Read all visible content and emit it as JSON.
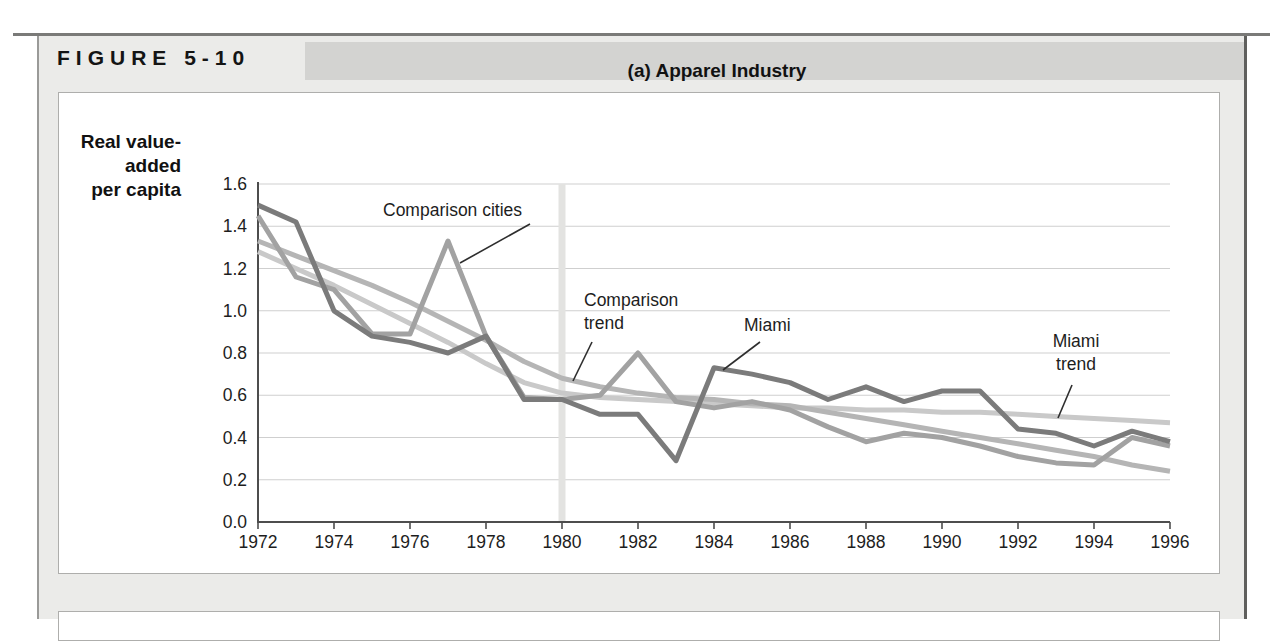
{
  "figure": {
    "label": "FIGURE 5-10"
  },
  "panel": {
    "title": "(a) Apparel Industry",
    "y_axis_label": "Real value-\nadded\nper capita"
  },
  "chart_data": {
    "type": "line",
    "title": "(a) Apparel Industry",
    "xlabel": "",
    "ylabel": "Real value-added per capita",
    "xlim": [
      1972,
      1996
    ],
    "ylim": [
      0.0,
      1.6
    ],
    "grid": "horizontal",
    "highlight_x": 1980,
    "x": [
      1972,
      1973,
      1974,
      1975,
      1976,
      1977,
      1978,
      1979,
      1980,
      1981,
      1982,
      1983,
      1984,
      1985,
      1986,
      1987,
      1988,
      1989,
      1990,
      1991,
      1992,
      1993,
      1994,
      1995,
      1996
    ],
    "x_tick_labels": [
      "1972",
      "1974",
      "1976",
      "1978",
      "1980",
      "1982",
      "1984",
      "1986",
      "1988",
      "1990",
      "1992",
      "1994",
      "1996"
    ],
    "y_ticks": [
      "0.0",
      "0.2",
      "0.4",
      "0.6",
      "0.8",
      "1.0",
      "1.2",
      "1.4",
      "1.6"
    ],
    "series": [
      {
        "name": "Miami",
        "color": "#7b7b7b",
        "values": [
          1.5,
          1.42,
          1.0,
          0.88,
          0.85,
          0.8,
          0.88,
          0.58,
          0.58,
          0.51,
          0.51,
          0.29,
          0.73,
          0.7,
          0.66,
          0.58,
          0.64,
          0.57,
          0.62,
          0.62,
          0.44,
          0.42,
          0.36,
          0.43,
          0.38
        ]
      },
      {
        "name": "Comparison cities",
        "color": "#a2a2a2",
        "values": [
          1.45,
          1.16,
          1.1,
          0.89,
          0.89,
          1.33,
          0.88,
          0.59,
          0.58,
          0.6,
          0.8,
          0.57,
          0.54,
          0.57,
          0.53,
          0.45,
          0.38,
          0.42,
          0.4,
          0.36,
          0.31,
          0.28,
          0.27,
          0.4,
          0.36
        ]
      },
      {
        "name": "Comparison trend",
        "color": "#b5b5b5",
        "values": [
          1.33,
          1.26,
          1.19,
          1.12,
          1.04,
          0.95,
          0.86,
          0.76,
          0.68,
          0.64,
          0.61,
          0.59,
          0.58,
          0.56,
          0.55,
          0.52,
          0.49,
          0.46,
          0.43,
          0.4,
          0.37,
          0.34,
          0.31,
          0.27,
          0.24
        ]
      },
      {
        "name": "Miami trend",
        "color": "#c9c9c9",
        "values": [
          1.28,
          1.2,
          1.12,
          1.03,
          0.94,
          0.85,
          0.75,
          0.66,
          0.61,
          0.59,
          0.58,
          0.57,
          0.56,
          0.55,
          0.54,
          0.54,
          0.53,
          0.53,
          0.52,
          0.52,
          0.51,
          0.5,
          0.49,
          0.48,
          0.47
        ]
      }
    ],
    "annotations": [
      {
        "text": "Comparison cities",
        "points_to_series": "Comparison cities"
      },
      {
        "text": "Comparison\ntrend",
        "points_to_series": "Comparison trend"
      },
      {
        "text": "Miami",
        "points_to_series": "Miami"
      },
      {
        "text": "Miami\ntrend",
        "points_to_series": "Miami trend"
      }
    ],
    "colors": {
      "gridline": "#cfcfcf",
      "axis": "#4d4d4d",
      "highlight_band": "#e3e3e1",
      "pointer_line": "#2e2e2e",
      "text": "#1d1d1d"
    }
  }
}
